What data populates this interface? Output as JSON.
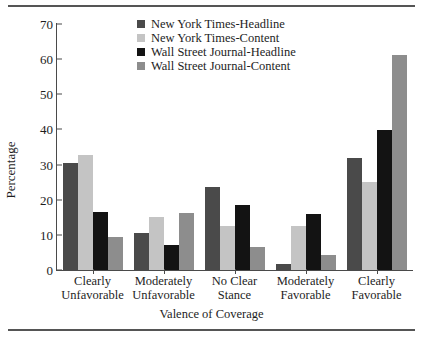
{
  "chart_data": {
    "type": "bar",
    "title": "",
    "xlabel": "Valence of Coverage",
    "ylabel": "Percentage",
    "ylim": [
      0,
      70
    ],
    "yticks": [
      0,
      10,
      20,
      30,
      40,
      50,
      60,
      70
    ],
    "grid": false,
    "legend_position": "top-center",
    "categories": [
      "Clearly\nUnfavorable",
      "Moderately\nUnfavorable",
      "No Clear\nStance",
      "Moderately\nFavorable",
      "Clearly\nFavorable"
    ],
    "series": [
      {
        "name": "New York Times-Headline",
        "color": "#4a4a4a",
        "values": [
          30.5,
          10.6,
          23.6,
          1.8,
          32.0
        ]
      },
      {
        "name": "New York Times-Content",
        "color": "#c4c4c4",
        "values": [
          32.8,
          15.0,
          12.6,
          12.5,
          25.0
        ]
      },
      {
        "name": "Wall Street Journal-Headline",
        "color": "#131313",
        "values": [
          16.4,
          7.0,
          18.5,
          16.0,
          39.7
        ]
      },
      {
        "name": "Wall Street Journal-Content",
        "color": "#8d8d8d",
        "values": [
          9.5,
          16.3,
          6.6,
          4.2,
          61.3
        ]
      }
    ]
  }
}
